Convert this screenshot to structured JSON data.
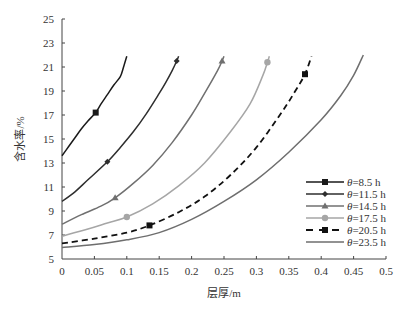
{
  "chart_data": {
    "type": "line",
    "title": "",
    "xlabel": "层厚/m",
    "ylabel": "含水率/%",
    "xlim": [
      0,
      0.5
    ],
    "ylim": [
      5,
      25
    ],
    "xticks": [
      0,
      0.05,
      0.1,
      0.15,
      0.2,
      0.25,
      0.3,
      0.35,
      0.4,
      0.45,
      0.5
    ],
    "xtick_labels": [
      "0",
      "0.05",
      "0.1",
      "0.15",
      "0.2",
      "0.25",
      "0.3",
      "0.35",
      "0.4",
      "0.45",
      "0.5"
    ],
    "yticks": [
      5,
      7,
      9,
      11,
      13,
      15,
      17,
      19,
      21,
      23,
      25
    ],
    "ytick_labels": [
      "5",
      "7",
      "9",
      "11",
      "13",
      "15",
      "17",
      "19",
      "21",
      "23",
      "25"
    ],
    "grid": false,
    "legend_position": "bottom-right",
    "series": [
      {
        "name": "θ=8.5 h",
        "symbol": "θ",
        "label_suffix": "=8.5 h",
        "color": "#1a1a1a",
        "dash": false,
        "marker": "square",
        "x": [
          0,
          0.01,
          0.02,
          0.03,
          0.04,
          0.052,
          0.06,
          0.07,
          0.08,
          0.09,
          0.095,
          0.1
        ],
        "y": [
          13.6,
          14.35,
          15.1,
          15.85,
          16.5,
          17.2,
          17.9,
          18.7,
          19.5,
          20.2,
          21.0,
          21.9
        ],
        "markers": [
          {
            "x": 0.052,
            "y": 17.2
          }
        ]
      },
      {
        "name": "θ=11.5 h",
        "symbol": "θ",
        "label_suffix": "=11.5 h",
        "color": "#2e2e2e",
        "dash": false,
        "marker": "diamond",
        "x": [
          0,
          0.02,
          0.04,
          0.07,
          0.09,
          0.11,
          0.13,
          0.15,
          0.16,
          0.17,
          0.177,
          0.18
        ],
        "y": [
          9.8,
          10.6,
          11.6,
          13.1,
          14.3,
          15.6,
          17.1,
          18.8,
          19.7,
          20.7,
          21.5,
          21.9
        ],
        "markers": [
          {
            "x": 0.07,
            "y": 13.1
          },
          {
            "x": 0.177,
            "y": 21.5
          }
        ]
      },
      {
        "name": "θ=14.5 h",
        "symbol": "θ",
        "label_suffix": "=14.5 h",
        "color": "#707070",
        "dash": false,
        "marker": "triangle",
        "x": [
          0,
          0.03,
          0.06,
          0.082,
          0.11,
          0.14,
          0.17,
          0.2,
          0.22,
          0.24,
          0.247,
          0.25
        ],
        "y": [
          7.9,
          8.7,
          9.4,
          10.1,
          11.3,
          12.8,
          14.7,
          17.0,
          18.8,
          20.7,
          21.5,
          21.9
        ],
        "markers": [
          {
            "x": 0.082,
            "y": 10.1
          },
          {
            "x": 0.247,
            "y": 21.5
          }
        ]
      },
      {
        "name": "θ=17.5 h",
        "symbol": "θ",
        "label_suffix": "=17.5 h",
        "color": "#a6a6a6",
        "dash": false,
        "marker": "circle",
        "x": [
          0,
          0.04,
          0.07,
          0.1,
          0.14,
          0.18,
          0.22,
          0.26,
          0.29,
          0.31,
          0.317,
          0.32
        ],
        "y": [
          6.9,
          7.5,
          8.0,
          8.5,
          9.6,
          11.1,
          13.0,
          15.6,
          17.9,
          20.3,
          21.4,
          21.9
        ],
        "markers": [
          {
            "x": 0.1,
            "y": 8.5
          },
          {
            "x": 0.317,
            "y": 21.4
          }
        ]
      },
      {
        "name": "θ=20.5 h",
        "symbol": "θ",
        "label_suffix": "=20.5 h",
        "color": "#111111",
        "dash": true,
        "marker": "square",
        "x": [
          0,
          0.05,
          0.1,
          0.135,
          0.18,
          0.22,
          0.26,
          0.3,
          0.34,
          0.36,
          0.375,
          0.385
        ],
        "y": [
          6.3,
          6.7,
          7.2,
          7.8,
          8.9,
          10.2,
          12.0,
          14.3,
          17.3,
          19.0,
          20.4,
          21.9
        ],
        "markers": [
          {
            "x": 0.135,
            "y": 7.8
          },
          {
            "x": 0.375,
            "y": 20.4
          }
        ]
      },
      {
        "name": "θ=23.5 h",
        "symbol": "θ",
        "label_suffix": "=23.5 h",
        "color": "#6e6e6e",
        "dash": false,
        "marker": "none",
        "x": [
          0,
          0.05,
          0.1,
          0.15,
          0.2,
          0.25,
          0.3,
          0.35,
          0.4,
          0.43,
          0.45,
          0.465
        ],
        "y": [
          5.95,
          6.2,
          6.6,
          7.2,
          8.3,
          9.8,
          11.6,
          13.9,
          16.6,
          18.6,
          20.3,
          22.0
        ],
        "markers": []
      }
    ]
  }
}
